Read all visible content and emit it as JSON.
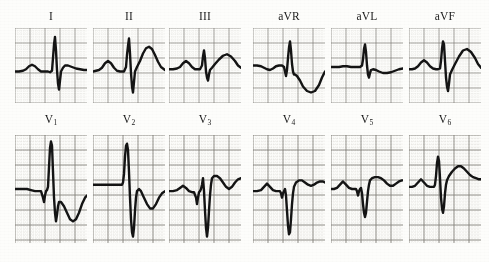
{
  "document": {
    "kind": "12-lead-electrocardiogram",
    "background_color": "#fdfdfb",
    "trace_color": "#141414",
    "grid_major_color": "#5d5a52",
    "grid_minor_color": "#9b968c",
    "rows": 2,
    "columns": 6
  },
  "labels": {
    "lead_I": "I",
    "lead_II": "II",
    "lead_III": "III",
    "lead_aVR": "aVR",
    "lead_aVL": "aVL",
    "lead_aVF": "aVF",
    "lead_V1_base": "V",
    "lead_V1_sub": "1",
    "lead_V2_base": "V",
    "lead_V2_sub": "2",
    "lead_V3_base": "V",
    "lead_V3_sub": "3",
    "lead_V4_base": "V",
    "lead_V4_sub": "4",
    "lead_V5_base": "V",
    "lead_V5_sub": "5",
    "lead_V6_base": "V",
    "lead_V6_sub": "6"
  },
  "chart_data": {
    "type": "line",
    "xlabel": "",
    "ylabel": "",
    "grid": true,
    "legend_position": "none",
    "panel_width": 72,
    "panel_height_top": 75,
    "panel_height_bottom": 108,
    "grid_major_mm": 15,
    "grid_minor_mm": 3,
    "series": [
      {
        "name": "I",
        "row": 0,
        "column": 0,
        "baseline_pct": 58,
        "points": "0,58 4,58 8,57 11,55 14,51 17,49 20,51 23,55 26,58 30,58 33,58 35,59 37,57 38,40 39,22 40,12 41,30 42,56 43,74 44,82 45,70 46,58 48,53 50,50 53,50 57,52 61,54 65,55 69,56 72,56"
      },
      {
        "name": "II",
        "row": 0,
        "column": 1,
        "baseline_pct": 58,
        "points": "0,58 3,57 6,56 9,53 12,47 15,44 18,47 21,53 24,57 27,58 29,58 31,58 33,52 34,36 35,24 36,14 37,34 38,60 39,78 40,86 41,72 42,58 44,52 47,44 50,34 53,27 56,25 59,28 62,36 65,45 68,52 72,56"
      },
      {
        "name": "III",
        "row": 0,
        "column": 2,
        "baseline_pct": 55,
        "points": "0,55 4,55 8,54 11,52 14,47 17,44 20,47 23,52 26,55 29,55 31,55 33,50 34,38 35,30 36,40 37,58 38,66 39,70 40,62 41,56 43,53 46,48 50,42 54,37 58,35 62,38 66,44 69,50 72,53"
      },
      {
        "name": "aVR",
        "row": 0,
        "column": 3,
        "baseline_pct": 50,
        "points": "0,50 4,50 8,51 11,53 14,55 17,56 20,54 23,51 26,50 29,50 31,52 32,58 33,64 34,56 35,40 36,26 37,18 38,30 39,48 40,58 41,62 42,62 44,64 47,70 50,78 54,84 58,86 62,84 66,76 69,66 72,58"
      },
      {
        "name": "aVL",
        "row": 0,
        "column": 4,
        "baseline_pct": 52,
        "points": "0,52 4,52 8,52 12,51 16,51 20,52 24,52 27,52 29,52 31,50 32,42 33,28 34,22 35,32 36,50 37,62 38,66 39,60 40,56 42,55 45,56 48,58 52,60 56,60 60,59 64,57 68,55 72,54"
      },
      {
        "name": "aVF",
        "row": 0,
        "column": 5,
        "baseline_pct": 55,
        "points": "0,55 3,55 6,54 9,51 12,46 15,43 18,46 21,51 24,54 27,55 29,55 31,54 32,44 33,28 34,18 35,22 36,44 37,66 38,78 39,84 40,74 41,62 43,56 46,48 50,38 54,30 58,28 62,32 66,40 69,48 72,53"
      },
      {
        "name": "V1",
        "row": 1,
        "column": 0,
        "baseline_pct": 50,
        "points": "0,50 4,50 8,50 12,50 16,51 20,52 24,52 26,52 28,58 29,62 30,56 31,52 32,51 33,48 34,30 35,12 36,6 37,10 38,34 39,58 40,72 41,80 42,74 43,66 44,62 46,62 49,66 52,72 55,78 58,80 61,78 64,72 67,64 70,58 72,56"
      },
      {
        "name": "V2",
        "row": 1,
        "column": 1,
        "baseline_pct": 46,
        "points": "0,46 4,46 8,46 12,46 16,46 20,46 24,46 27,46 29,46 30,44 31,36 32,20 33,10 34,8 35,14 36,34 37,58 38,78 39,90 40,94 41,86 42,70 43,58 44,52 46,50 48,52 51,58 54,64 57,68 60,68 63,64 66,58 69,54 72,52"
      },
      {
        "name": "V3",
        "row": 1,
        "column": 2,
        "baseline_pct": 52,
        "points": "0,52 4,52 8,51 11,49 14,47 17,49 20,52 23,53 25,53 27,58 28,64 29,58 30,53 31,52 32,50 33,46 34,40 35,52 36,70 37,86 38,94 39,86 40,70 41,56 42,46 43,40 45,38 48,38 51,40 54,44 57,48 60,50 63,48 66,44 69,41 72,40"
      },
      {
        "name": "V4",
        "row": 1,
        "column": 3,
        "baseline_pct": 52,
        "points": "0,52 4,52 8,51 11,48 14,45 17,48 20,51 23,52 25,52 27,52 28,54 29,58 30,54 31,52 32,50 33,56 34,70 35,84 36,92 37,90 38,78 39,64 40,54 41,48 43,44 46,42 49,42 52,44 55,46 58,47 61,46 64,44 67,43 70,43 72,44"
      },
      {
        "name": "V5",
        "row": 1,
        "column": 4,
        "baseline_pct": 50,
        "points": "0,50 3,50 6,49 9,46 12,43 15,46 18,49 21,50 23,50 25,50 26,52 27,56 28,52 29,50 30,49 31,54 32,64 33,72 34,76 35,72 36,62 37,52 38,46 39,42 41,40 44,39 47,39 50,40 53,42 56,45 59,47 62,47 65,45 68,43 71,42 72,42"
      },
      {
        "name": "V6",
        "row": 1,
        "column": 5,
        "baseline_pct": 48,
        "points": "0,48 3,48 6,47 9,44 12,41 15,44 18,47 21,48 23,48 25,48 26,46 27,38 28,26 29,20 30,24 31,40 32,58 33,68 34,72 35,66 36,54 37,46 38,42 40,38 43,34 46,31 49,29 52,29 55,31 58,34 61,37 64,39 67,40 70,41 72,41"
      }
    ]
  },
  "panels": [
    {
      "key": "I",
      "x": 15,
      "y": 28,
      "w": 72,
      "h": 75,
      "label_x": 15,
      "label_y": 10,
      "sub": null
    },
    {
      "key": "II",
      "x": 93,
      "y": 28,
      "w": 72,
      "h": 75,
      "label_x": 93,
      "label_y": 10,
      "sub": null
    },
    {
      "key": "III",
      "x": 169,
      "y": 28,
      "w": 72,
      "h": 75,
      "label_x": 169,
      "label_y": 10,
      "sub": null
    },
    {
      "key": "aVR",
      "x": 253,
      "y": 28,
      "w": 72,
      "h": 75,
      "label_x": 253,
      "label_y": 10,
      "sub": null
    },
    {
      "key": "aVL",
      "x": 331,
      "y": 28,
      "w": 72,
      "h": 75,
      "label_x": 331,
      "label_y": 10,
      "sub": null
    },
    {
      "key": "aVF",
      "x": 409,
      "y": 28,
      "w": 72,
      "h": 75,
      "label_x": 409,
      "label_y": 10,
      "sub": null
    },
    {
      "key": "V1",
      "x": 15,
      "y": 135,
      "w": 72,
      "h": 108,
      "label_x": 15,
      "label_y": 114,
      "sub": "1"
    },
    {
      "key": "V2",
      "x": 93,
      "y": 135,
      "w": 72,
      "h": 108,
      "label_x": 93,
      "label_y": 114,
      "sub": "2"
    },
    {
      "key": "V3",
      "x": 169,
      "y": 135,
      "w": 72,
      "h": 108,
      "label_x": 169,
      "label_y": 114,
      "sub": "3"
    },
    {
      "key": "V4",
      "x": 253,
      "y": 135,
      "w": 72,
      "h": 108,
      "label_x": 253,
      "label_y": 114,
      "sub": "4"
    },
    {
      "key": "V5",
      "x": 331,
      "y": 135,
      "w": 72,
      "h": 108,
      "label_x": 331,
      "label_y": 114,
      "sub": "5"
    },
    {
      "key": "V6",
      "x": 409,
      "y": 135,
      "w": 72,
      "h": 108,
      "label_x": 409,
      "label_y": 114,
      "sub": "6"
    }
  ]
}
